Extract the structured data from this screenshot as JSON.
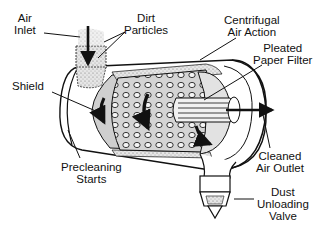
{
  "diagram": {
    "labels": {
      "air_inlet": [
        "Air",
        "Inlet"
      ],
      "dirt_particles": [
        "Dirt",
        "Particles"
      ],
      "centrifugal_air_action": [
        "Centrifugal",
        "Air Action"
      ],
      "pleated_paper_filter": [
        "Pleated",
        "Paper Filter"
      ],
      "shield": [
        "Shield"
      ],
      "precleaning_starts": [
        "Precleaning",
        "Starts"
      ],
      "cleaned_air_outlet": [
        "Cleaned",
        "Air Outlet"
      ],
      "dust_unloading_valve": [
        "Dust",
        "Unloading",
        "Valve"
      ]
    },
    "colors": {
      "line": "#111111",
      "shading": "#cfcfcf",
      "background": "#ffffff"
    }
  }
}
